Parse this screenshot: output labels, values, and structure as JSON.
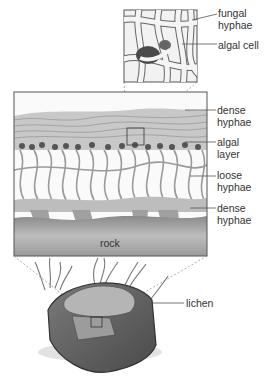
{
  "figure": {
    "labels": {
      "fungal_hyphae": "fungal\nhyphae",
      "algal_cell": "algal cell",
      "dense_hyphae_top": "dense\nhyphae",
      "algal_layer": "algal\nlayer",
      "loose_hyphae": "loose\nhyphae",
      "dense_hyphae_bottom": "dense\nhyphae",
      "rock": "rock",
      "lichen": "lichen"
    },
    "colors": {
      "line": "#555555",
      "rock_dark": "#6e6e6e",
      "rock_mid": "#a8a8a8",
      "rock_light": "#d6d6d6",
      "hyphae": "#9a9a9a"
    }
  }
}
